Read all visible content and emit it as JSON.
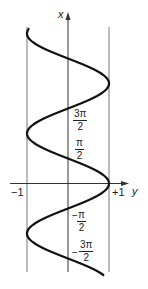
{
  "chart_data": {
    "type": "line",
    "title": "",
    "xlabel": "y",
    "ylabel": "x",
    "function": "y = cos x",
    "axis_orientation": "x vertical (upward), y horizontal (rightward)",
    "xlim": [
      -1,
      1
    ],
    "ylim_x_axis_range": [
      "-5π/2",
      "5π/2"
    ],
    "horizontal_tick_labels": [
      "-1",
      "+1"
    ],
    "vertical_tick_labels": [
      "3π/2",
      "π/2",
      "-π/2",
      "-3π/2"
    ],
    "points": [
      {
        "x": "0",
        "y": 1
      },
      {
        "x": "π/2",
        "y": 0
      },
      {
        "x": "π",
        "y": -1
      },
      {
        "x": "3π/2",
        "y": 0
      },
      {
        "x": "2π",
        "y": 1
      },
      {
        "x": "5π/2",
        "y": 0
      },
      {
        "x": "-π/2",
        "y": 0
      },
      {
        "x": "-π",
        "y": -1
      },
      {
        "x": "-3π/2",
        "y": 0
      }
    ],
    "grid": false,
    "legend": null
  },
  "labels": {
    "x_axis_name": "x",
    "y_axis_name": "y",
    "minus_one": "−1",
    "plus_one": "+1",
    "pi": "π",
    "three_pi": "3π",
    "two": "2",
    "minus": "−"
  },
  "style": {
    "curve_color": "#111111",
    "axis_color": "#333333",
    "bound_color": "#666666"
  }
}
